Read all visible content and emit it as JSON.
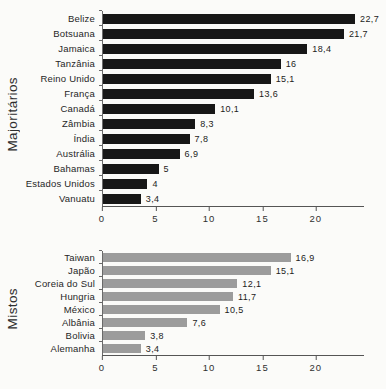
{
  "figure": {
    "background": "#fbfbf9",
    "decimal_separator": ","
  },
  "chart_data": [
    {
      "type": "bar",
      "orientation": "horizontal",
      "group_label": "Majoritários",
      "bar_color": "#171717",
      "categories": [
        "Belize",
        "Botsuana",
        "Jamaica",
        "Tanzânia",
        "Reino Unido",
        "França",
        "Canadá",
        "Zâmbia",
        "Índia",
        "Austrália",
        "Bahamas",
        "Estados Unidos",
        "Vanuatu"
      ],
      "values": [
        22.7,
        21.7,
        18.4,
        16,
        15.1,
        13.6,
        10.1,
        8.3,
        7.8,
        6.9,
        5,
        4,
        3.4
      ],
      "value_labels": [
        "22,7",
        "21,7",
        "18,4",
        "16",
        "15,1",
        "13,6",
        "10,1",
        "8,3",
        "7,8",
        "6,9",
        "5",
        "4",
        "3,4"
      ],
      "xlabel": "",
      "ylabel": "Majoritários",
      "xticks": [
        0,
        5,
        10,
        15,
        20
      ],
      "xtick_labels": [
        "0",
        "5",
        "10",
        "15",
        "20"
      ],
      "xlim": [
        0,
        24.5
      ],
      "grid": false,
      "legend": null
    },
    {
      "type": "bar",
      "orientation": "horizontal",
      "group_label": "Mistos",
      "bar_color": "#9c9c9c",
      "categories": [
        "Taiwan",
        "Japão",
        "Coreia do Sul",
        "Hungria",
        "México",
        "Albânia",
        "Bolivia",
        "Alemanha"
      ],
      "values": [
        16.9,
        15.1,
        12.1,
        11.7,
        10.5,
        7.6,
        3.8,
        3.4
      ],
      "value_labels": [
        "16,9",
        "15,1",
        "12,1",
        "11,7",
        "10,5",
        "7,6",
        "3,8",
        "3,4"
      ],
      "xlabel": "",
      "ylabel": "Mistos",
      "xticks": [
        0,
        5,
        10,
        15,
        20
      ],
      "xtick_labels": [
        "0",
        "5",
        "10",
        "15",
        "20"
      ],
      "xlim": [
        0,
        24.5
      ],
      "grid": false,
      "legend": null
    }
  ]
}
